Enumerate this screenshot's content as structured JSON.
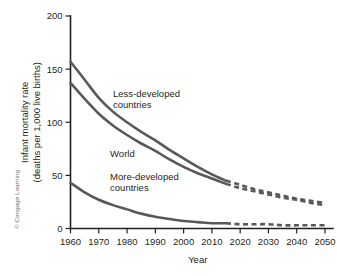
{
  "credit": "© Cengage Learning",
  "chart_data": {
    "type": "line",
    "title": "",
    "xlabel": "Year",
    "ylabel_line1": "Infant mortality rate",
    "ylabel_line2": "(deaths per 1,000 live births)",
    "xlim": [
      1960,
      2050
    ],
    "ylim": [
      0,
      200
    ],
    "xticks": [
      1960,
      1970,
      1980,
      1990,
      2000,
      2010,
      2020,
      2030,
      2040,
      2050
    ],
    "xtick_labels": [
      "1960",
      "1970",
      "1980",
      "1990",
      "2000",
      "2010",
      "2020",
      "2030",
      "2040",
      "2050"
    ],
    "yticks": [
      0,
      50,
      100,
      150,
      200
    ],
    "ytick_labels": [
      "0",
      "50",
      "100",
      "150",
      "200"
    ],
    "grid": false,
    "legend_position": "inline-annotations",
    "projection_starts": 2015,
    "line_color": "#58595b",
    "axis_color": "#231f20",
    "series": [
      {
        "name": "Less-developed countries",
        "label": "Less-developed",
        "label_line2": "countries",
        "label_x": 1975,
        "label_y": 124,
        "x": [
          1960,
          1965,
          1970,
          1975,
          1980,
          1985,
          1990,
          1995,
          2000,
          2005,
          2010,
          2015
        ],
        "values": [
          157,
          140,
          123,
          110,
          100,
          91,
          83,
          74,
          66,
          58,
          51,
          45
        ],
        "projection_x": [
          2015,
          2020,
          2025,
          2030,
          2035,
          2040,
          2045,
          2050
        ],
        "projection_values": [
          45,
          41,
          37,
          34,
          31,
          28,
          26,
          24
        ]
      },
      {
        "name": "World",
        "label": "World",
        "label_x": 1974,
        "label_y": 67,
        "x": [
          1960,
          1965,
          1970,
          1975,
          1980,
          1985,
          1990,
          1995,
          2000,
          2005,
          2010,
          2015
        ],
        "values": [
          137,
          122,
          108,
          97,
          88,
          80,
          73,
          65,
          58,
          52,
          47,
          42
        ],
        "projection_x": [
          2015,
          2020,
          2025,
          2030,
          2035,
          2040,
          2045,
          2050
        ],
        "projection_values": [
          42,
          38,
          35,
          32,
          29,
          27,
          24,
          22
        ]
      },
      {
        "name": "More-developed countries",
        "label": "More-developed",
        "label_line2": "countries",
        "label_x": 1974,
        "label_y": 46,
        "x": [
          1960,
          1965,
          1970,
          1975,
          1980,
          1985,
          1990,
          1995,
          2000,
          2005,
          2010,
          2015
        ],
        "values": [
          43,
          34,
          27,
          22,
          18,
          14,
          11,
          9,
          7,
          6,
          5,
          5
        ],
        "projection_x": [
          2015,
          2020,
          2025,
          2030,
          2035,
          2040,
          2045,
          2050
        ],
        "projection_values": [
          5,
          4,
          4,
          4,
          3,
          3,
          3,
          3
        ]
      }
    ]
  }
}
